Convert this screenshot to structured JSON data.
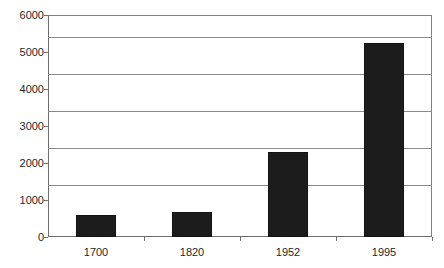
{
  "chart_data": {
    "type": "bar",
    "title": "",
    "subtitle": "",
    "xlabel": "",
    "ylabel": "",
    "categories": [
      "1700",
      "1820",
      "1952",
      "1995"
    ],
    "values": [
      600,
      680,
      2300,
      5250
    ],
    "series": [
      {
        "name": "",
        "values": [
          600,
          680,
          2300,
          5250
        ]
      }
    ],
    "ylim": [
      0,
      6000
    ],
    "yticks": [
      0,
      1000,
      2000,
      3000,
      4000,
      5000,
      6000
    ],
    "ytick_labels": [
      "0",
      "1000",
      "2000",
      "3000",
      "4000",
      "5000",
      "6000"
    ],
    "grid": true,
    "grid_axis": "y",
    "legend": false,
    "legend_position": "none",
    "bar_color": "#1c1c1c",
    "grid_color": "#8a8a8a",
    "axis_color": "#6e6e6e",
    "background_color": "#ffffff",
    "annotations": []
  }
}
